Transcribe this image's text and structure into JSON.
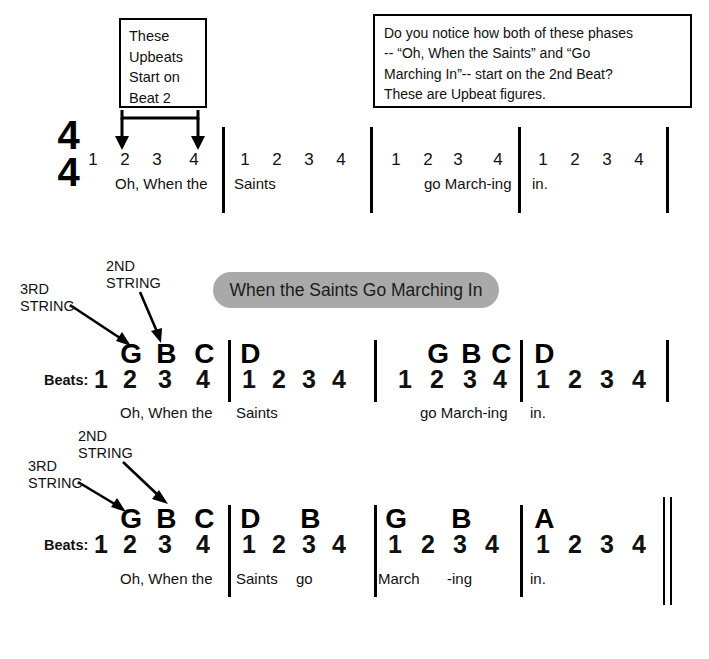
{
  "callouts": {
    "upbeats": {
      "lines": [
        "These",
        "Upbeats",
        "Start on",
        "Beat 2"
      ]
    },
    "notice": {
      "lines": [
        "Do you notice how both of these phases",
        "-- “Oh, When the Saints” and “Go",
        "Marching In”-- start on the 2nd Beat?",
        "These are Upbeat figures."
      ]
    }
  },
  "time_signature": {
    "top": "4",
    "bottom": "4"
  },
  "title": "When the Saints Go Marching In",
  "labels": {
    "beats": "Beats:",
    "third_string": [
      "3RD",
      "STRING"
    ],
    "second_string": [
      "2ND",
      "STRING"
    ]
  },
  "colors": {
    "banner_gray": "#a9a9a9",
    "ink": "#000000"
  },
  "systems": [
    {
      "name": "count-only-system",
      "measures": [
        {
          "beats": [
            "1",
            "2",
            "3",
            "4"
          ],
          "lyrics": [
            {
              "beat": 2,
              "text": "Oh, When the"
            }
          ],
          "notes": []
        },
        {
          "beats": [
            "1",
            "2",
            "3",
            "4"
          ],
          "lyrics": [
            {
              "beat": 1,
              "text": "Saints"
            }
          ],
          "notes": []
        },
        {
          "beats": [
            "1",
            "2",
            "3",
            "4"
          ],
          "lyrics": [
            {
              "beat": 3,
              "text": "go  March-ing"
            }
          ],
          "notes": []
        },
        {
          "beats": [
            "1",
            "2",
            "3",
            "4"
          ],
          "lyrics": [
            {
              "beat": 1,
              "text": "in."
            }
          ],
          "notes": []
        }
      ]
    },
    {
      "name": "tab-system-first",
      "measures": [
        {
          "beats": [
            "1",
            "2",
            "3",
            "4"
          ],
          "notes": [
            {
              "beat": 2,
              "name": "G"
            },
            {
              "beat": 3,
              "name": "B"
            },
            {
              "beat": 4,
              "name": "C"
            }
          ],
          "lyrics": [
            {
              "beat": 2,
              "text": "Oh, When  the"
            }
          ]
        },
        {
          "beats": [
            "1",
            "2",
            "3",
            "4"
          ],
          "notes": [
            {
              "beat": 1,
              "name": "D"
            }
          ],
          "lyrics": [
            {
              "beat": 1,
              "text": "Saints"
            }
          ]
        },
        {
          "beats": [
            "1",
            "2",
            "3",
            "4"
          ],
          "notes": [
            {
              "beat": 2,
              "name": "G"
            },
            {
              "beat": 3,
              "name": "B"
            },
            {
              "beat": 4,
              "name": "C"
            }
          ],
          "lyrics": [
            {
              "beat": 3,
              "text": "go  March-ing"
            }
          ]
        },
        {
          "beats": [
            "1",
            "2",
            "3",
            "4"
          ],
          "notes": [
            {
              "beat": 1,
              "name": "D"
            }
          ],
          "lyrics": [
            {
              "beat": 1,
              "text": "in."
            }
          ]
        }
      ]
    },
    {
      "name": "tab-system-second",
      "measures": [
        {
          "beats": [
            "1",
            "2",
            "3",
            "4"
          ],
          "notes": [
            {
              "beat": 2,
              "name": "G"
            },
            {
              "beat": 3,
              "name": "B"
            },
            {
              "beat": 4,
              "name": "C"
            }
          ],
          "lyrics": [
            {
              "beat": 2,
              "text": "Oh, When the"
            }
          ]
        },
        {
          "beats": [
            "1",
            "2",
            "3",
            "4"
          ],
          "notes": [
            {
              "beat": 1,
              "name": "D"
            },
            {
              "beat": 3,
              "name": "B"
            }
          ],
          "lyrics": [
            {
              "beat": 1,
              "text": "Saints"
            },
            {
              "beat": 3,
              "text": "go"
            }
          ]
        },
        {
          "beats": [
            "1",
            "2",
            "3",
            "4"
          ],
          "notes": [
            {
              "beat": 1,
              "name": "G"
            },
            {
              "beat": 3,
              "name": "B"
            }
          ],
          "lyrics": [
            {
              "beat": 1,
              "text": "March"
            },
            {
              "beat": 3,
              "text": "-ing"
            }
          ]
        },
        {
          "beats": [
            "1",
            "2",
            "3",
            "4"
          ],
          "notes": [
            {
              "beat": 1,
              "name": "A"
            }
          ],
          "lyrics": [
            {
              "beat": 1,
              "text": "in."
            }
          ]
        }
      ]
    }
  ]
}
